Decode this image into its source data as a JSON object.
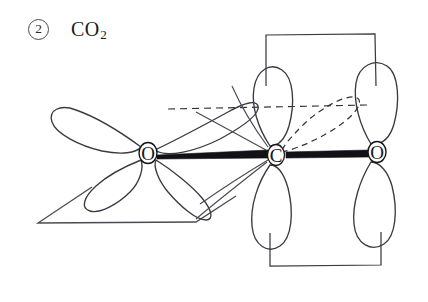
{
  "figure": {
    "title_marker": "2",
    "formula_main": "CO",
    "formula_sub": "2",
    "caption_full": "CO2",
    "stroke_color": "#3a3a42",
    "bond_color": "#111116",
    "background": "#ffffff",
    "atoms": [
      {
        "id": "O-left",
        "label": "O",
        "x": 148,
        "y": 153
      },
      {
        "id": "C-center",
        "label": "C",
        "x": 276,
        "y": 155
      },
      {
        "id": "O-right",
        "label": "O",
        "x": 377,
        "y": 152
      }
    ],
    "bonds": [
      {
        "id": "bond-O-left-C",
        "from": "O-left",
        "to": "C-center",
        "style": "solid-thick"
      },
      {
        "id": "bond-C-O-right",
        "from": "C-center",
        "to": "O-right",
        "style": "solid-thick"
      }
    ],
    "orbitals": [
      {
        "id": "O-left-lobe-upper-left",
        "atom": "O-left",
        "direction": "upper-left",
        "style": "solid"
      },
      {
        "id": "O-left-lobe-lower-left",
        "atom": "O-left",
        "direction": "lower-left",
        "style": "solid"
      },
      {
        "id": "O-left-lobe-upper-right",
        "atom": "O-left",
        "direction": "upper-right",
        "style": "solid"
      },
      {
        "id": "O-left-lobe-lower-right",
        "atom": "O-left",
        "direction": "lower-right",
        "style": "solid"
      },
      {
        "id": "C-lobe-up",
        "atom": "C-center",
        "direction": "up",
        "style": "solid"
      },
      {
        "id": "C-lobe-down",
        "atom": "C-center",
        "direction": "down",
        "style": "solid"
      },
      {
        "id": "C-lobe-dashed-upright",
        "atom": "C-center",
        "direction": "upper-right",
        "style": "dashed"
      },
      {
        "id": "C-lobe-lower-left",
        "atom": "C-center",
        "direction": "lower-left",
        "style": "solid"
      },
      {
        "id": "O-right-lobe-up",
        "atom": "O-right",
        "direction": "up",
        "style": "solid"
      },
      {
        "id": "O-right-lobe-down",
        "atom": "O-right",
        "direction": "down",
        "style": "solid"
      }
    ],
    "guides": [
      {
        "id": "guide-box-top",
        "shape": "open-rectangle",
        "style": "solid"
      },
      {
        "id": "guide-box-bottom",
        "shape": "open-rectangle",
        "style": "solid"
      },
      {
        "id": "guide-parallelogram-left",
        "shape": "parallelogram",
        "style": "solid"
      },
      {
        "id": "guide-dashed-horizontal",
        "shape": "line",
        "style": "dashed"
      }
    ]
  }
}
